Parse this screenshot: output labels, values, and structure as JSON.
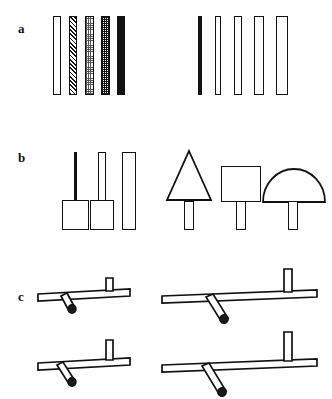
{
  "figure": {
    "background": "#ffffff",
    "ink": "#111111",
    "width": 332,
    "height": 399,
    "panels": [
      {
        "id": "a",
        "label": "a",
        "label_x": 18,
        "label_y": 22,
        "description": "Two series of slender vertical bars",
        "groups": [
          {
            "name": "left-series-fill-gradient",
            "bars": [
              {
                "name": "bar-a-left-1",
                "fill": "white",
                "x": 53,
                "y": 16,
                "w": 8,
                "h": 79
              },
              {
                "name": "bar-a-left-2",
                "fill": "hatch",
                "x": 69,
                "y": 16,
                "w": 8,
                "h": 79
              },
              {
                "name": "bar-a-left-3",
                "fill": "dots-light",
                "x": 85,
                "y": 16,
                "w": 9,
                "h": 79
              },
              {
                "name": "bar-a-left-4",
                "fill": "dots-dense",
                "x": 101,
                "y": 16,
                "w": 9,
                "h": 79
              },
              {
                "name": "bar-a-left-5",
                "fill": "solid",
                "x": 117,
                "y": 16,
                "w": 8,
                "h": 79
              }
            ]
          },
          {
            "name": "right-series-width-gradient",
            "bars": [
              {
                "name": "bar-a-right-1",
                "fill": "solid",
                "x": 198,
                "y": 16,
                "w": 4,
                "h": 79
              },
              {
                "name": "bar-a-right-2",
                "fill": "white",
                "x": 215,
                "y": 16,
                "w": 6,
                "h": 79
              },
              {
                "name": "bar-a-right-3",
                "fill": "white",
                "x": 234,
                "y": 16,
                "w": 8,
                "h": 79
              },
              {
                "name": "bar-a-right-4",
                "fill": "white",
                "x": 254,
                "y": 16,
                "w": 10,
                "h": 79
              },
              {
                "name": "bar-a-right-5",
                "fill": "white",
                "x": 276,
                "y": 16,
                "w": 12,
                "h": 79
              }
            ]
          }
        ]
      },
      {
        "id": "b",
        "label": "b",
        "label_x": 18,
        "label_y": 158,
        "description": "Stemmed shapes: increasing stem width, then varied head shapes",
        "groups": [
          {
            "name": "left-series-stem-width",
            "items": [
              {
                "name": "stemmed-shape-b-1",
                "head": "rect",
                "stem_fill": "solid",
                "stem_x": 74,
                "stem_y": 152,
                "stem_w": 3,
                "stem_h": 48,
                "head_x": 62,
                "head_y": 200,
                "head_w": 27,
                "head_h": 30
              },
              {
                "name": "stemmed-shape-b-2",
                "head": "rect",
                "stem_fill": "white",
                "stem_x": 98,
                "stem_y": 152,
                "stem_w": 8,
                "stem_h": 48,
                "head_x": 90,
                "head_y": 200,
                "head_w": 24,
                "head_h": 30
              },
              {
                "name": "stemmed-shape-b-3",
                "head": "none",
                "stem_fill": "white",
                "stem_x": 122,
                "stem_y": 152,
                "stem_w": 14,
                "stem_h": 78,
                "head_x": 0,
                "head_y": 0,
                "head_w": 0,
                "head_h": 0
              }
            ]
          },
          {
            "name": "right-series-head-shape",
            "items": [
              {
                "name": "stemmed-shape-b-4",
                "head": "triangle",
                "stem_x": 184,
                "stem_y": 202,
                "stem_w": 10,
                "stem_h": 28,
                "head_x": 166,
                "head_y": 150,
                "head_w": 46,
                "head_h": 52
              },
              {
                "name": "stemmed-shape-b-5",
                "head": "square",
                "stem_x": 236,
                "stem_y": 202,
                "stem_w": 10,
                "stem_h": 28,
                "head_x": 221,
                "head_y": 166,
                "head_w": 40,
                "head_h": 36
              },
              {
                "name": "stemmed-shape-b-6",
                "head": "semicircle",
                "stem_x": 288,
                "stem_y": 202,
                "stem_w": 10,
                "stem_h": 28,
                "head_x": 262,
                "head_y": 165,
                "head_w": 62,
                "head_h": 37
              }
            ]
          }
        ]
      },
      {
        "id": "c",
        "label": "c",
        "label_x": 18,
        "label_y": 297,
        "description": "Four lever diagrams: horizontal beam with vertical post and angled downward arm",
        "items": [
          {
            "name": "lever-diagram-c-1",
            "x": 36,
            "y": 276,
            "beam_len": 92,
            "post_h": 13,
            "post_at": 0.72,
            "arm_len": 16,
            "arm_angle": 62
          },
          {
            "name": "lever-diagram-c-2",
            "x": 162,
            "y": 268,
            "beam_len": 155,
            "post_h": 21,
            "post_at": 0.75,
            "arm_len": 33,
            "arm_angle": 62
          },
          {
            "name": "lever-diagram-c-3",
            "x": 36,
            "y": 341,
            "beam_len": 92,
            "post_h": 20,
            "post_at": 0.72,
            "arm_len": 24,
            "arm_angle": 62
          },
          {
            "name": "lever-diagram-c-4",
            "x": 162,
            "y": 333,
            "beam_len": 155,
            "post_h": 28,
            "post_at": 0.75,
            "arm_len": 44,
            "arm_angle": 62
          }
        ]
      }
    ]
  }
}
